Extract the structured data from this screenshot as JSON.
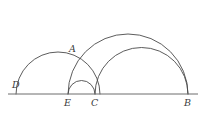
{
  "figure": {
    "canvas": {
      "width": 205,
      "height": 118
    },
    "colors": {
      "background": "#ffffff",
      "arc_stroke": "#4a4a4a",
      "baseline_stroke": "#6d6d6d",
      "label_color": "#3b3b3b"
    },
    "baseline": {
      "name": "baseline-DB",
      "y": 94,
      "x_start": 8,
      "x_end": 198
    },
    "points": [
      {
        "key": "D",
        "label": "D",
        "x": 16,
        "y": 94,
        "label_x": 12,
        "label_y": 80
      },
      {
        "key": "E",
        "label": "E",
        "x": 68,
        "y": 94,
        "label_x": 64,
        "label_y": 98
      },
      {
        "key": "C",
        "label": "C",
        "x": 95,
        "y": 94,
        "label_x": 91,
        "label_y": 98
      },
      {
        "key": "B",
        "label": "B",
        "x": 188,
        "y": 94,
        "label_x": 184,
        "label_y": 98
      },
      {
        "key": "A",
        "label": "A",
        "x": 76,
        "y": 57,
        "label_x": 69,
        "label_y": 44
      }
    ],
    "arcs": [
      {
        "name": "semicircle-DC",
        "from": "D",
        "to": "C",
        "x1": 16,
        "x2": 100,
        "apex_y": 52,
        "radius": 42
      },
      {
        "name": "semicircle-EC",
        "from": "E",
        "to": "C",
        "x1": 68,
        "x2": 95,
        "apex_y": 80,
        "radius": 13.5
      },
      {
        "name": "semicircle-EB",
        "from": "E",
        "to": "B",
        "x1": 68,
        "x2": 188,
        "apex_y": 34,
        "radius": 60
      },
      {
        "name": "semicircle-CB",
        "from": "C",
        "to": "B",
        "x1": 95,
        "x2": 188,
        "apex_y": 47,
        "radius": 46.5
      }
    ]
  }
}
